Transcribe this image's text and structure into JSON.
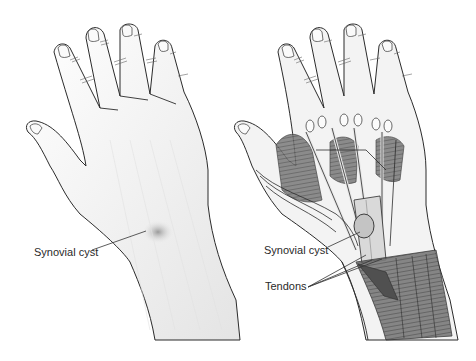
{
  "figure": {
    "panels": [
      {
        "name": "external-view",
        "labels": [
          {
            "text": "Synovial cyst",
            "x": 34,
            "y": 246
          }
        ]
      },
      {
        "name": "anatomical-view",
        "labels": [
          {
            "text": "Synovial cyst",
            "x": 264,
            "y": 244
          },
          {
            "text": "Tendons",
            "x": 265,
            "y": 280
          }
        ]
      }
    ],
    "colors": {
      "outline": "#2b2b2b",
      "skin": "#f2f2f2",
      "shade": "#c8c8c8",
      "muscle": "#6e6e6e",
      "tendon": "#e6e6e6",
      "cyst": "#bdbdbd"
    }
  }
}
